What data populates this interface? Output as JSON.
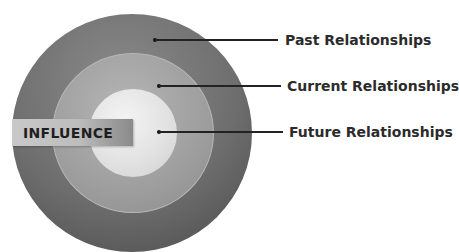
{
  "diagram": {
    "type": "concentric-circles",
    "center_label": "INFLUENCE",
    "rings": [
      {
        "id": "outer",
        "label": "Past Relationships",
        "color": "#6e6e6e"
      },
      {
        "id": "middle",
        "label": "Current Relationships",
        "color": "#a3a3a3"
      },
      {
        "id": "inner",
        "label": "Future Relationships",
        "color": "#e6e6e6"
      }
    ]
  }
}
